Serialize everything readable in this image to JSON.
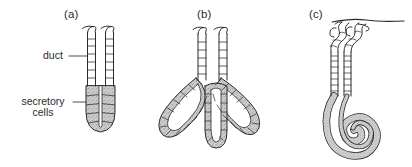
{
  "figure": {
    "background_color": "#ffffff",
    "ink_color": "#2b2b2b",
    "cell_fill_color": "#c9c9c9",
    "lumen_fill_color": "#ffffff",
    "width": 412,
    "height": 167
  },
  "panels": [
    {
      "id": "a",
      "label": "(a)",
      "description": "simple unbranched gland with straight duct and bulbous secretory end-piece"
    },
    {
      "id": "b",
      "label": "(b)",
      "description": "branched gland with three tubular secretory lobes"
    },
    {
      "id": "c",
      "label": "(c)",
      "description": "coiled gland opening at the skin surface with spiral secretory portion"
    }
  ],
  "annotations": [
    {
      "id": "duct",
      "text": "duct",
      "lines": [
        "duct"
      ],
      "leader": true
    },
    {
      "id": "secretory-cells",
      "text": "secretory cells",
      "lines": [
        "secretory",
        "cells"
      ],
      "leader": true
    }
  ]
}
